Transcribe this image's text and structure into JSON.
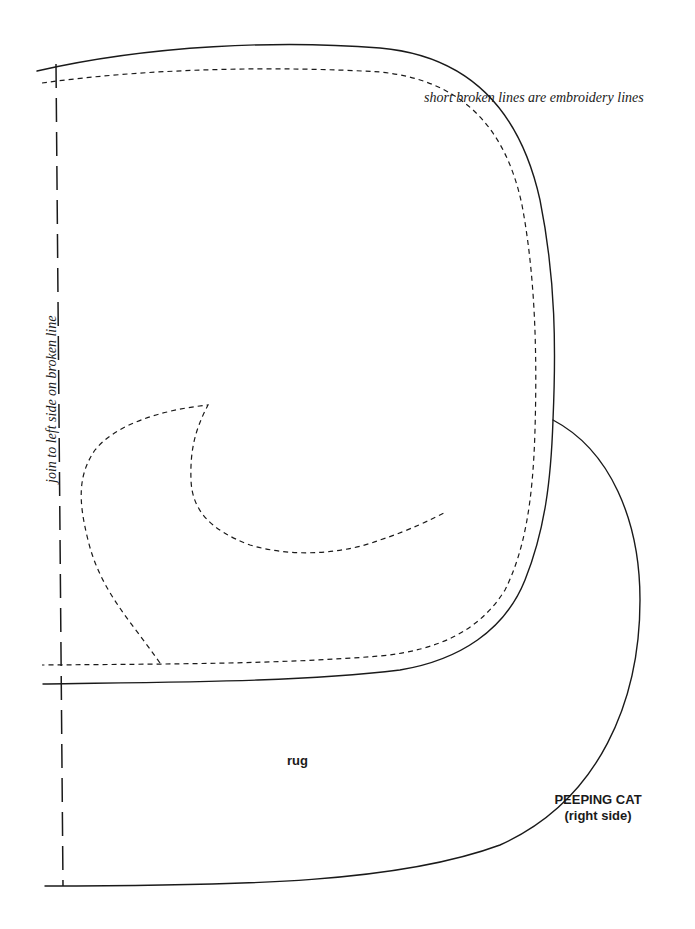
{
  "page": {
    "width": 695,
    "height": 929,
    "background": "#ffffff",
    "ink_color": "#1a1a1a"
  },
  "annotations": {
    "embroidery_note": "short broken lines are embroidery lines",
    "join_note": "join to left side on broken line"
  },
  "labels": {
    "rug": "rug",
    "title": "PEEPING CAT",
    "subtitle": "(right side)"
  },
  "pattern_pieces": [
    {
      "name": "head-body-outline",
      "line": "solid"
    },
    {
      "name": "seam-allowance-inner",
      "line": "short-dash"
    },
    {
      "name": "paw-embroidery",
      "line": "short-dash"
    },
    {
      "name": "rug-outline",
      "line": "solid"
    },
    {
      "name": "fold-join-line",
      "line": "long-dash"
    }
  ]
}
